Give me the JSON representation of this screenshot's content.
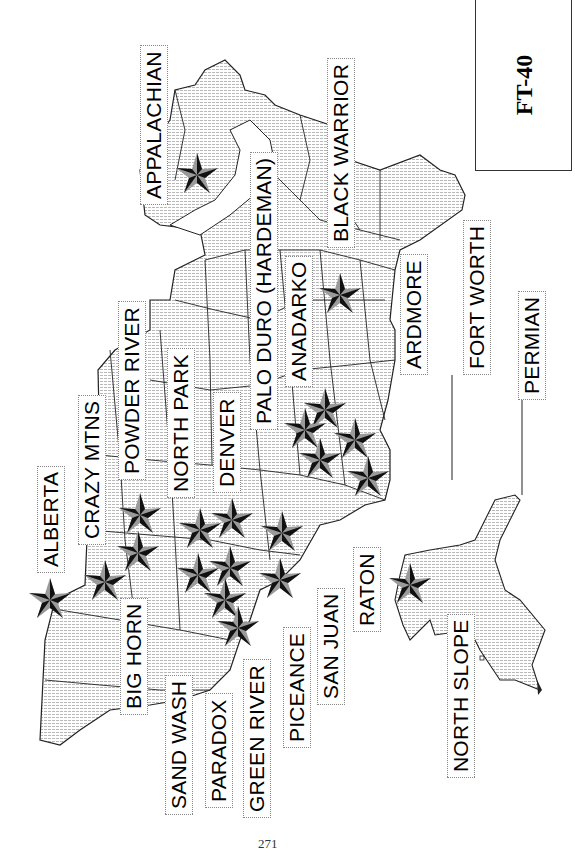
{
  "figure": {
    "id": "FT-40",
    "page_number": "271"
  },
  "basins": [
    {
      "name": "APPALACHIAN"
    },
    {
      "name": "BLACK WARRIOR"
    },
    {
      "name": "ARDMORE"
    },
    {
      "name": "FORT WORTH"
    },
    {
      "name": "PERMIAN"
    },
    {
      "name": "ANADARKO"
    },
    {
      "name": "PALO DURO (HARDEMAN)"
    },
    {
      "name": "DENVER"
    },
    {
      "name": "NORTH PARK"
    },
    {
      "name": "POWDER RIVER"
    },
    {
      "name": "CRAZY MTNS"
    },
    {
      "name": "ALBERTA"
    },
    {
      "name": "BIG HORN"
    },
    {
      "name": "SAND WASH"
    },
    {
      "name": "PARADOX"
    },
    {
      "name": "GREEN RIVER"
    },
    {
      "name": "PICEANCE"
    },
    {
      "name": "SAN JUAN"
    },
    {
      "name": "RATON"
    },
    {
      "name": "NORTH SLOPE"
    }
  ],
  "colors": {
    "land_fill": "#e6e6e6",
    "border": "#222222",
    "star_dark": "#111111",
    "star_light": "#9a9a9a"
  }
}
